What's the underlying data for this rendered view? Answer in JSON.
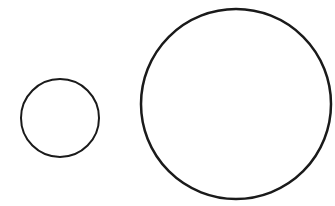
{
  "diagram": {
    "background": "#ffffff",
    "stroke_color": "#1a1a1a",
    "shapes": [
      {
        "type": "circle",
        "label": "small-circle",
        "cx": 60,
        "cy": 118,
        "r": 39,
        "stroke_width": 2
      },
      {
        "type": "circle",
        "label": "large-circle",
        "cx": 236,
        "cy": 104,
        "r": 95,
        "stroke_width": 2.5
      }
    ]
  }
}
